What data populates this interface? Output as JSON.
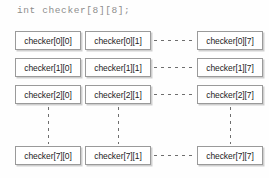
{
  "figure": {
    "title": "int checker[8][8];",
    "type": "array-memory-layout-diagram",
    "colors": {
      "background": "#fefefe",
      "box_border": "#9a9a9a",
      "box_fill": "#ffffff",
      "box_shadow": "#cfcfcf",
      "title_text": "#8d8d8d",
      "cell_text": "#232323",
      "connector": "#6e6e6e"
    },
    "grid": {
      "rows": [
        {
          "row_index": 0,
          "cells": [
            {
              "label": "checker[0][0]",
              "column_index": 0
            },
            {
              "label": "checker[0][1]",
              "column_index": 1
            },
            {
              "label": "checker[0][7]",
              "column_index": 7
            }
          ],
          "horizontal_ellipsis": true
        },
        {
          "row_index": 1,
          "cells": [
            {
              "label": "checker[1][0]",
              "column_index": 0
            },
            {
              "label": "checker[1][1]",
              "column_index": 1
            },
            {
              "label": "checker[1][7]",
              "column_index": 7
            }
          ],
          "horizontal_ellipsis": true
        },
        {
          "row_index": 2,
          "cells": [
            {
              "label": "checker[2][0]",
              "column_index": 0
            },
            {
              "label": "checker[2][1]",
              "column_index": 1
            },
            {
              "label": "checker[2][7]",
              "column_index": 7
            }
          ],
          "horizontal_ellipsis": true
        },
        {
          "row_index": 7,
          "cells": [
            {
              "label": "checker[7][0]",
              "column_index": 0
            },
            {
              "label": "checker[7][1]",
              "column_index": 1
            },
            {
              "label": "checker[7][7]",
              "column_index": 7
            }
          ],
          "horizontal_ellipsis": true
        }
      ],
      "vertical_ellipsis_columns": [
        0,
        1,
        7
      ]
    }
  }
}
